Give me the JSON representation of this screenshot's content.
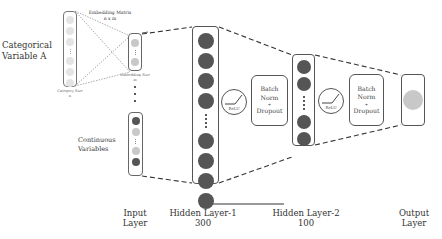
{
  "diagram": {
    "inputs": {
      "categorical_label": "Categorical Variable A",
      "categorical_line1": "Categorical",
      "categorical_line2": "Variable A",
      "embedding_matrix_title": "Embedding Matrix",
      "embedding_matrix_dims": "n x m",
      "category_size_label": "Category Size",
      "category_size_symbol": "n",
      "embedding_size_label": "Embedding Size",
      "embedding_size_symbol": "m",
      "continuous_line1": "Continuous",
      "continuous_line2": "Variables"
    },
    "layers": [
      {
        "id": "input",
        "line1": "Input",
        "line2": "Layer"
      },
      {
        "id": "hidden1",
        "line1": "Hidden Layer-1",
        "line2": "300",
        "units": 300
      },
      {
        "id": "hidden2",
        "line1": "Hidden Layer-2",
        "line2": "100",
        "units": 100
      },
      {
        "id": "output",
        "line1": "Output",
        "line2": "Layer"
      }
    ],
    "blocks": {
      "relu_1": "ReLU",
      "relu_2": "ReLU",
      "bn_dropout_1": {
        "line1": "Batch",
        "line2": "Norm",
        "line3": "+",
        "line4": "Dropout"
      },
      "bn_dropout_2": {
        "line1": "Batch",
        "line2": "Norm",
        "line3": "+",
        "line4": "Dropout"
      }
    },
    "colors": {
      "dark_node": "#555555",
      "light_node": "#c8c8c8",
      "faint_node": "#e4e4e4",
      "output_node": "#c8c8c8",
      "border": "#555555"
    }
  }
}
